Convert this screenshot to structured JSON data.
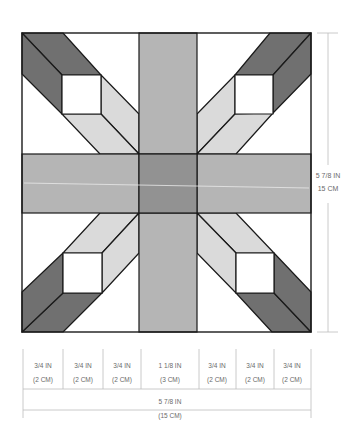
{
  "colors": {
    "outline": "#1a1a1a",
    "white": "#ffffff",
    "dark": "#707070",
    "medium": "#b5b5b5",
    "center": "#929292",
    "light": "#dadada",
    "dimension_line": "#bdbdbd",
    "dimension_text": "#6a6a6a"
  },
  "block": {
    "name": "Quilt block diagram",
    "pieces": [
      "dark diagonal bands",
      "light diagonal bands",
      "white corner squares",
      "medium cross sashing",
      "dark center square"
    ]
  },
  "vertical_dimension": {
    "imperial": "5 7/8 IN",
    "metric": "15 CM"
  },
  "column_dimensions": [
    {
      "imperial": "3/4 IN",
      "metric": "(2 CM)"
    },
    {
      "imperial": "3/4 IN",
      "metric": "(2 CM)"
    },
    {
      "imperial": "3/4 IN",
      "metric": "(2 CM)"
    },
    {
      "imperial": "1 1/8 IN",
      "metric": "(3 CM)"
    },
    {
      "imperial": "3/4 IN",
      "metric": "(2 CM)"
    },
    {
      "imperial": "3/4 IN",
      "metric": "(2 CM)"
    },
    {
      "imperial": "3/4 IN",
      "metric": "(2 CM)"
    }
  ],
  "total_width": {
    "imperial": "5 7/8 IN",
    "metric": "(15 CM)"
  }
}
